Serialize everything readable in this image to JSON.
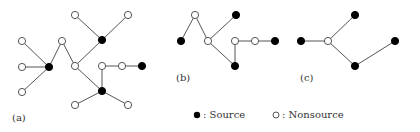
{
  "colors": {
    "source": "#000000",
    "nonsource_fill": "#ffffff",
    "stroke": "#555555"
  },
  "panels": [
    {
      "label": "(a)",
      "label_pos": [
        12,
        112
      ],
      "nodes": [
        {
          "id": "a1",
          "x": 22,
          "y": 41,
          "type": "nonsource"
        },
        {
          "id": "a2",
          "x": 22,
          "y": 67,
          "type": "nonsource"
        },
        {
          "id": "a3",
          "x": 22,
          "y": 92,
          "type": "nonsource"
        },
        {
          "id": "a4",
          "x": 49,
          "y": 67,
          "type": "source"
        },
        {
          "id": "a5",
          "x": 62,
          "y": 41,
          "type": "nonsource"
        },
        {
          "id": "a6",
          "x": 75,
          "y": 66,
          "type": "nonsource"
        },
        {
          "id": "a7",
          "x": 75,
          "y": 15,
          "type": "nonsource"
        },
        {
          "id": "a8",
          "x": 128,
          "y": 15,
          "type": "nonsource"
        },
        {
          "id": "a9",
          "x": 102,
          "y": 40,
          "type": "source"
        },
        {
          "id": "a10",
          "x": 102,
          "y": 66,
          "type": "nonsource"
        },
        {
          "id": "a11",
          "x": 122,
          "y": 66,
          "type": "nonsource"
        },
        {
          "id": "a12",
          "x": 142,
          "y": 66,
          "type": "source"
        },
        {
          "id": "a13",
          "x": 102,
          "y": 91,
          "type": "source"
        },
        {
          "id": "a14",
          "x": 75,
          "y": 105,
          "type": "nonsource"
        },
        {
          "id": "a15",
          "x": 128,
          "y": 105,
          "type": "nonsource"
        }
      ],
      "edges": [
        [
          "a1",
          "a4"
        ],
        [
          "a2",
          "a4"
        ],
        [
          "a3",
          "a4"
        ],
        [
          "a4",
          "a5"
        ],
        [
          "a5",
          "a6"
        ],
        [
          "a6",
          "a9"
        ],
        [
          "a7",
          "a9"
        ],
        [
          "a8",
          "a9"
        ],
        [
          "a6",
          "a13"
        ],
        [
          "a10",
          "a13"
        ],
        [
          "a10",
          "a11"
        ],
        [
          "a11",
          "a12"
        ],
        [
          "a13",
          "a14"
        ],
        [
          "a13",
          "a15"
        ]
      ]
    },
    {
      "label": "(b)",
      "label_pos": [
        176,
        72
      ],
      "nodes": [
        {
          "id": "b1",
          "x": 181,
          "y": 41,
          "type": "source"
        },
        {
          "id": "b2",
          "x": 195,
          "y": 15,
          "type": "nonsource"
        },
        {
          "id": "b3",
          "x": 208,
          "y": 41,
          "type": "nonsource"
        },
        {
          "id": "b4",
          "x": 236,
          "y": 15,
          "type": "source"
        },
        {
          "id": "b5",
          "x": 235,
          "y": 66,
          "type": "source"
        },
        {
          "id": "b6",
          "x": 235,
          "y": 41,
          "type": "nonsource"
        },
        {
          "id": "b7",
          "x": 255,
          "y": 41,
          "type": "nonsource"
        },
        {
          "id": "b8",
          "x": 275,
          "y": 41,
          "type": "source"
        }
      ],
      "edges": [
        [
          "b1",
          "b2"
        ],
        [
          "b2",
          "b3"
        ],
        [
          "b3",
          "b4"
        ],
        [
          "b3",
          "b5"
        ],
        [
          "b6",
          "b5"
        ],
        [
          "b6",
          "b7"
        ],
        [
          "b7",
          "b8"
        ]
      ]
    },
    {
      "label": "(c)",
      "label_pos": [
        300,
        72
      ],
      "nodes": [
        {
          "id": "c1",
          "x": 301,
          "y": 41,
          "type": "source"
        },
        {
          "id": "c2",
          "x": 328,
          "y": 41,
          "type": "nonsource"
        },
        {
          "id": "c3",
          "x": 355,
          "y": 15,
          "type": "source"
        },
        {
          "id": "c4",
          "x": 355,
          "y": 66,
          "type": "source"
        },
        {
          "id": "c5",
          "x": 395,
          "y": 41,
          "type": "source"
        }
      ],
      "edges": [
        [
          "c1",
          "c2"
        ],
        [
          "c2",
          "c3"
        ],
        [
          "c2",
          "c4"
        ],
        [
          "c4",
          "c5"
        ]
      ]
    }
  ],
  "legend": {
    "source_label": ": Source",
    "nonsource_label": ": Nonsource"
  }
}
